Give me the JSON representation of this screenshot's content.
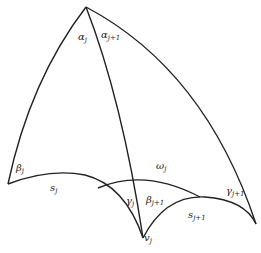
{
  "diagram": {
    "type": "hyperbolic-geometry-figure",
    "stroke_color": "#222222",
    "labels": {
      "alpha_j": {
        "base": "α",
        "sub": "j"
      },
      "alpha_j1": {
        "base": "α",
        "sub": "j+1"
      },
      "beta_j": {
        "base": "β",
        "sub": "j"
      },
      "s_j": {
        "base": "s",
        "sub": "j"
      },
      "omega_j": {
        "base": "ω",
        "sub": "j"
      },
      "gamma_j": {
        "base": "γ",
        "sub": "j"
      },
      "beta_j1": {
        "base": "β",
        "sub": "j+1"
      },
      "gamma_j1": {
        "base": "γ",
        "sub": "j+1"
      },
      "s_j1": {
        "base": "s",
        "sub": "j+1"
      },
      "v_j": {
        "base": "v",
        "sub": "j"
      }
    }
  }
}
